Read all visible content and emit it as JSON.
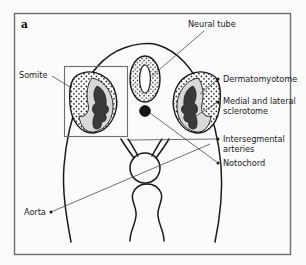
{
  "figure": {
    "panel_letter": "a",
    "frame_color": "#6e6e6e",
    "background_color": "#fbfbfb",
    "ink_color": "#1a1a1a",
    "label_color": "#1a1a1a",
    "sclerotome_dark_color": "#3a3a3a",
    "sclerotome_light_color": "#d9d9d9",
    "stipple_color": "#262626",
    "notochord_color": "#141414"
  },
  "labels": {
    "neural_tube": "Neural tube",
    "somite": "Somite",
    "dermatomyotome": "Dermatomyotome",
    "medial_lateral_sclerotome_line1": "Medial and lateral",
    "medial_lateral_sclerotome_line2": "sclerotome",
    "intersegmental_arteries_line1": "Intersegmental",
    "intersegmental_arteries_line2": "arteries",
    "notochord": "Notochord",
    "aorta": "Aorta"
  },
  "structures": [
    {
      "name": "neural-tube",
      "description": "dorsal oval ring with stippled wall and slit lumen"
    },
    {
      "name": "notochord",
      "description": "small solid dark circle ventral to neural tube"
    },
    {
      "name": "somite-left",
      "description": "stippled dermatomyotome with dark medial and lateral sclerotome"
    },
    {
      "name": "somite-right",
      "description": "stippled dermatomyotome with dark medial and lateral sclerotome"
    },
    {
      "name": "dorsal-aorta",
      "description": "midline circle with paired intersegmental artery branches"
    },
    {
      "name": "gut-tube",
      "description": "ventral narrow looped tube"
    },
    {
      "name": "embryo-outline",
      "description": "outer body wall contour of embryo cross-section"
    },
    {
      "name": "somite-inset-box",
      "description": "rectangular region of interest around left somite"
    }
  ]
}
